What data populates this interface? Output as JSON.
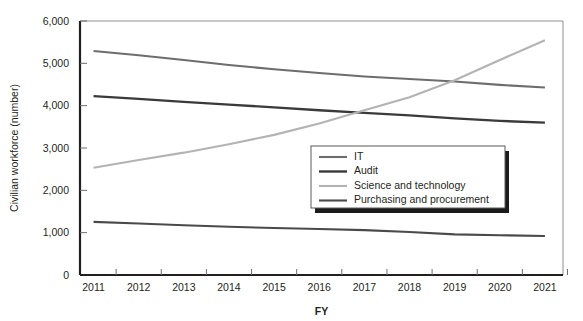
{
  "chart_data": {
    "type": "line",
    "title": "",
    "xlabel": "FY",
    "ylabel": "Civilian workforce (number)",
    "x": [
      2011,
      2012,
      2013,
      2014,
      2015,
      2016,
      2017,
      2018,
      2019,
      2020,
      2021
    ],
    "xtick_labels": [
      "2011",
      "2012",
      "2013",
      "2014",
      "2015",
      "2016",
      "2017",
      "2018",
      "2019",
      "2020",
      "2021"
    ],
    "ytick_labels": [
      "0",
      "1,000",
      "2,000",
      "3,000",
      "4,000",
      "5,000",
      "6,000"
    ],
    "yticks": [
      0,
      1000,
      2000,
      3000,
      4000,
      5000,
      6000
    ],
    "ylim": [
      0,
      6000
    ],
    "xlim": [
      2010.7,
      2021.4
    ],
    "grid": false,
    "legend_position": "inside-center-right",
    "series": [
      {
        "name": "IT",
        "color": "#6d6d6d",
        "width": 2.1,
        "values": [
          5290,
          5190,
          5080,
          4960,
          4860,
          4770,
          4690,
          4630,
          4570,
          4490,
          4430
        ]
      },
      {
        "name": "Audit",
        "color": "#3a3a3a",
        "width": 2.4,
        "values": [
          4225,
          4160,
          4090,
          4025,
          3960,
          3890,
          3830,
          3770,
          3700,
          3640,
          3600
        ]
      },
      {
        "name": "Science and technology",
        "color": "#b3b3b3",
        "width": 2.1,
        "values": [
          2535,
          2715,
          2890,
          3090,
          3310,
          3580,
          3890,
          4200,
          4600,
          5080,
          5545
        ]
      },
      {
        "name": "Purchasing and procurement",
        "color": "#4a4a4a",
        "width": 2.1,
        "values": [
          1255,
          1215,
          1175,
          1140,
          1110,
          1085,
          1060,
          1015,
          960,
          940,
          920
        ]
      }
    ]
  },
  "legend": {
    "entries": [
      {
        "label": "IT"
      },
      {
        "label": "Audit"
      },
      {
        "label": "Science and technology"
      },
      {
        "label": "Purchasing and procurement"
      }
    ]
  },
  "colors": {
    "axis": "#231f20",
    "frame": "#8f8f8f",
    "background": "#ffffff",
    "it": "#6d6d6d",
    "audit": "#3a3a3a",
    "science_and_technology": "#b3b3b3",
    "purchasing_and_procurement": "#4a4a4a"
  }
}
